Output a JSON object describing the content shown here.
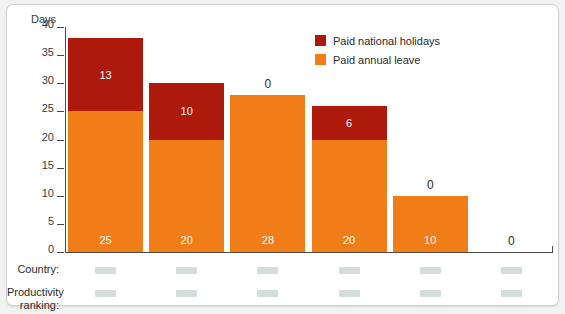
{
  "chart_data": {
    "type": "bar",
    "title": "",
    "subtitle": "",
    "xlabel": "",
    "ylabel": "Days",
    "ylim": [
      0,
      40
    ],
    "yticks": [
      0,
      5,
      10,
      15,
      20,
      25,
      30,
      35,
      40
    ],
    "grid": false,
    "stacked": true,
    "legend_position": "top-right",
    "categories": [
      "",
      "",
      "",
      "",
      "",
      ""
    ],
    "series": [
      {
        "name": "Paid annual leave",
        "color": "#f07d18",
        "values": [
          25,
          20,
          28,
          20,
          10,
          0
        ]
      },
      {
        "name": "Paid national holidays",
        "color": "#ad1a0c",
        "values": [
          13,
          10,
          0,
          6,
          0,
          0
        ]
      }
    ],
    "totals": [
      38,
      30,
      28,
      26,
      10,
      0
    ],
    "annotations": [
      {
        "bar": 1,
        "text": "13",
        "placement": "inside-upper"
      },
      {
        "bar": 1,
        "text": "25",
        "placement": "inside-lower"
      },
      {
        "bar": 2,
        "text": "10",
        "placement": "inside-upper"
      },
      {
        "bar": 2,
        "text": "20",
        "placement": "inside-lower"
      },
      {
        "bar": 3,
        "text": "0",
        "placement": "above"
      },
      {
        "bar": 3,
        "text": "28",
        "placement": "inside-lower"
      },
      {
        "bar": 4,
        "text": "6",
        "placement": "inside-upper"
      },
      {
        "bar": 4,
        "text": "20",
        "placement": "inside-lower"
      },
      {
        "bar": 5,
        "text": "0",
        "placement": "above"
      },
      {
        "bar": 5,
        "text": "10",
        "placement": "inside-lower"
      },
      {
        "bar": 6,
        "text": "0",
        "placement": "above"
      }
    ]
  },
  "axis": {
    "y_title": "Days",
    "ticks": [
      "40",
      "35",
      "30",
      "25",
      "20",
      "15",
      "10",
      "5",
      "0"
    ]
  },
  "legend": {
    "items": [
      {
        "label": "Paid national holidays",
        "color": "#ad1a0c"
      },
      {
        "label": "Paid annual leave",
        "color": "#f07d18"
      }
    ]
  },
  "bars": [
    {
      "upper_value": "13",
      "lower_value": "25",
      "above_value": ""
    },
    {
      "upper_value": "10",
      "lower_value": "20",
      "above_value": ""
    },
    {
      "upper_value": "",
      "lower_value": "28",
      "above_value": "0"
    },
    {
      "upper_value": "6",
      "lower_value": "20",
      "above_value": ""
    },
    {
      "upper_value": "",
      "lower_value": "10",
      "above_value": "0"
    },
    {
      "upper_value": "",
      "lower_value": "",
      "above_value": "0"
    }
  ],
  "footer": {
    "country_label": "Country:",
    "ranking_label": "Productivity\nranking:",
    "redacted_values": [
      "",
      "",
      "",
      "",
      "",
      ""
    ]
  },
  "colors": {
    "annual_leave": "#f07d18",
    "national_holidays": "#ad1a0c",
    "panel_background": "#ffffff",
    "page_background": "#f2f2f2",
    "axis": "#4a4a4a",
    "redaction": "#d4dcdc"
  }
}
